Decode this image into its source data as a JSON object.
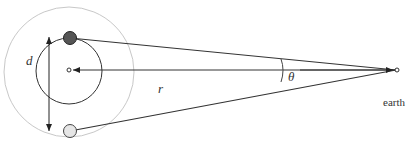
{
  "diagram": {
    "title": "",
    "labels": {
      "d": "d",
      "r": "r",
      "theta": "θ",
      "earth": "earth"
    },
    "colors": {
      "line": "#333333",
      "outer_circle": "#c8c8c8",
      "dark_body": "#555555",
      "light_body": "#e6e6e6"
    }
  }
}
